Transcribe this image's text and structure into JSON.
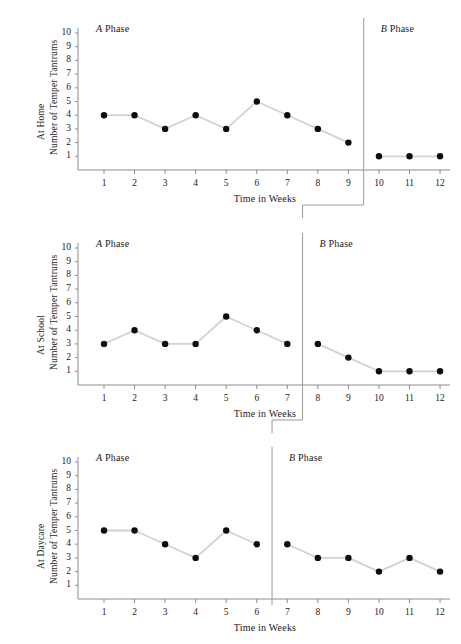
{
  "figure": {
    "title": "",
    "background": "#ffffff",
    "marker_color": "#0d0d0d",
    "line_color": "#d2d2d2",
    "axis_color": "#8d8d8d"
  },
  "axis": {
    "xlabel": "Time in Weeks",
    "yticks": [
      "10",
      "9",
      "8",
      "7",
      "6",
      "5",
      "4",
      "3",
      "2",
      "1"
    ],
    "xticks": [
      "1",
      "2",
      "3",
      "4",
      "5",
      "6",
      "7",
      "8",
      "9",
      "10",
      "11",
      "12"
    ]
  },
  "phase_labels": {
    "a_letter": "A",
    "b_letter": "B",
    "word": "Phase"
  },
  "chart_data": [
    {
      "type": "line",
      "title": "",
      "ylabel_line1": "At Home",
      "ylabel_line2": "Number of Temper Tantrums",
      "xlabel": "Time in Weeks",
      "x": [
        1,
        2,
        3,
        4,
        5,
        6,
        7,
        8,
        9,
        10,
        11,
        12
      ],
      "values": [
        4,
        4,
        3,
        4,
        3,
        5,
        4,
        3,
        2,
        1,
        1,
        1
      ],
      "ylim": [
        0,
        10
      ],
      "xlim": [
        0,
        13
      ],
      "grid": false,
      "phase_a_label": "A Phase",
      "phase_b_label": "B Phase",
      "phase_change_after_week": 9,
      "phase_a_weeks": [
        1,
        2,
        3,
        4,
        5,
        6,
        7,
        8,
        9
      ],
      "phase_b_weeks": [
        10,
        11,
        12
      ],
      "phase_a_values": [
        4,
        4,
        3,
        4,
        3,
        5,
        4,
        3,
        2
      ],
      "phase_b_values": [
        1,
        1,
        1
      ]
    },
    {
      "type": "line",
      "title": "",
      "ylabel_line1": "At School",
      "ylabel_line2": "Number of Temper Tantrums",
      "xlabel": "Time in Weeks",
      "x": [
        1,
        2,
        3,
        4,
        5,
        6,
        7,
        8,
        9,
        10,
        11,
        12
      ],
      "values": [
        3,
        4,
        3,
        3,
        5,
        4,
        3,
        3,
        2,
        1,
        1,
        1
      ],
      "ylim": [
        0,
        10
      ],
      "xlim": [
        0,
        13
      ],
      "grid": false,
      "phase_a_label": "A Phase",
      "phase_b_label": "B Phase",
      "phase_change_after_week": 7,
      "phase_a_weeks": [
        1,
        2,
        3,
        4,
        5,
        6,
        7
      ],
      "phase_b_weeks": [
        8,
        9,
        10,
        11,
        12
      ],
      "phase_a_values": [
        3,
        4,
        3,
        3,
        5,
        4,
        3
      ],
      "phase_b_values": [
        3,
        2,
        1,
        1,
        1
      ]
    },
    {
      "type": "line",
      "title": "",
      "ylabel_line1": "At Daycare",
      "ylabel_line2": "Number of Temper Tantrums",
      "xlabel": "Time in Weeks",
      "x": [
        1,
        2,
        3,
        4,
        5,
        6,
        7,
        8,
        9,
        10,
        11,
        12
      ],
      "values": [
        5,
        5,
        4,
        3,
        5,
        4,
        4,
        3,
        3,
        2,
        3,
        2
      ],
      "ylim": [
        0,
        10
      ],
      "xlim": [
        0,
        13
      ],
      "grid": false,
      "phase_a_label": "A Phase",
      "phase_b_label": "B Phase",
      "phase_change_after_week": 6,
      "phase_a_weeks": [
        1,
        2,
        3,
        4,
        5,
        6
      ],
      "phase_b_weeks": [
        7,
        8,
        9,
        10,
        11,
        12
      ],
      "phase_a_values": [
        5,
        5,
        4,
        3,
        5,
        4
      ],
      "phase_b_values": [
        4,
        3,
        3,
        2,
        3,
        2
      ]
    }
  ]
}
